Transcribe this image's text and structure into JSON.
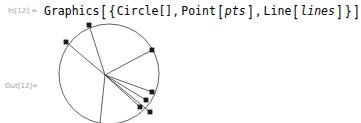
{
  "notebook": {
    "background_color": "#ffffff",
    "input_cell": {
      "label": "In[12]:=",
      "label_color": "#9aa4b0",
      "code_tokens": [
        {
          "t": "Graphics",
          "kind": "head"
        },
        {
          "t": "[",
          "kind": "bracket"
        },
        {
          "t": "{",
          "kind": "brace"
        },
        {
          "t": "Circle",
          "kind": "head"
        },
        {
          "t": "[",
          "kind": "bracket"
        },
        {
          "t": "]",
          "kind": "bracket"
        },
        {
          "t": ",",
          "kind": "comma"
        },
        {
          "t": "Point",
          "kind": "head"
        },
        {
          "t": "[",
          "kind": "bracket"
        },
        {
          "t": "pts",
          "kind": "symbol"
        },
        {
          "t": "]",
          "kind": "bracket"
        },
        {
          "t": ",",
          "kind": "comma"
        },
        {
          "t": "Line",
          "kind": "head"
        },
        {
          "t": "[",
          "kind": "bracket"
        },
        {
          "t": "lines",
          "kind": "symbol"
        },
        {
          "t": "]",
          "kind": "bracket"
        },
        {
          "t": "}",
          "kind": "brace"
        },
        {
          "t": "]",
          "kind": "bracket"
        }
      ],
      "text": {
        "graphics": "Graphics",
        "open_bracket_1": "[",
        "open_brace": "{",
        "circle": "Circle",
        "circle_args": "[]",
        "comma_1": ",",
        "point": "Point",
        "open_bracket_2": "[",
        "pts": "pts",
        "close_bracket_2": "]",
        "comma_2": ",",
        "line": "Line",
        "open_bracket_3": "[",
        "lines": "lines",
        "close_bracket_3": "]",
        "close_brace": "}",
        "close_bracket_1": "]"
      }
    },
    "output_cell": {
      "label": "Out[12]=",
      "label_color": "#9aa4b0"
    }
  },
  "chart_data": {
    "type": "scatter",
    "title": "",
    "xlabel": "",
    "ylabel": "",
    "stroke_color": "#3a3a3a",
    "point_color": "#1a1a1a",
    "circle": {
      "center_px": [
        109,
        74
      ],
      "radius_px": 50,
      "stroke_width": 0.8
    },
    "convergence_point_px": [
      105,
      75
    ],
    "points_px": [
      [
        89,
        25
      ],
      [
        66,
        42
      ],
      [
        152,
        50
      ],
      [
        152,
        92
      ],
      [
        146,
        100
      ],
      [
        140,
        107
      ],
      [
        150,
        112
      ]
    ],
    "point_radius_px": 2.4,
    "lines": [
      {
        "from_px": [
          105,
          75
        ],
        "to_px": [
          89,
          25
        ]
      },
      {
        "from_px": [
          105,
          75
        ],
        "to_px": [
          66,
          42
        ]
      },
      {
        "from_px": [
          105,
          75
        ],
        "to_px": [
          152,
          50
        ]
      },
      {
        "from_px": [
          105,
          75
        ],
        "to_px": [
          152,
          92
        ]
      },
      {
        "from_px": [
          105,
          75
        ],
        "to_px": [
          146,
          100
        ]
      },
      {
        "from_px": [
          105,
          75
        ],
        "to_px": [
          140,
          107
        ]
      },
      {
        "from_px": [
          105,
          75
        ],
        "to_px": [
          150,
          112
        ]
      },
      {
        "from_px": [
          105,
          75
        ],
        "to_px": [
          100,
          123
        ]
      }
    ],
    "legend": [],
    "grid": false
  }
}
